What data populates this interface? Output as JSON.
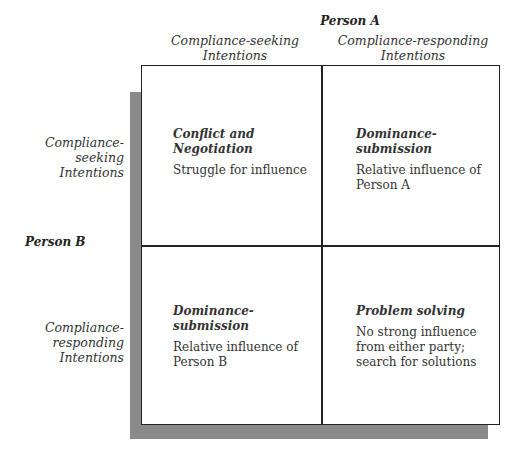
{
  "diagram": {
    "type": "2x2-matrix",
    "axis_top": {
      "label": "Person A",
      "columns": [
        {
          "line1": "Compliance-seeking",
          "line2": "Intentions"
        },
        {
          "line1": "Compliance-responding",
          "line2": "Intentions"
        }
      ]
    },
    "axis_left": {
      "label": "Person B",
      "rows": [
        {
          "line1": "Compliance-",
          "line2": "seeking",
          "line3": "Intentions"
        },
        {
          "line1": "Compliance-",
          "line2": "responding",
          "line3": "Intentions"
        }
      ]
    },
    "cells": [
      {
        "title": "Conflict and Negotiation",
        "lines": [
          "Struggle for influence"
        ]
      },
      {
        "title": "Dominance-submission",
        "lines": [
          "Relative influence of",
          "Person A"
        ]
      },
      {
        "title": "Dominance-submission",
        "lines": [
          "Relative influence of",
          "Person B"
        ]
      },
      {
        "title": "Problem solving",
        "lines": [
          "No strong influence",
          "from either party;",
          "search for solutions"
        ]
      }
    ],
    "colors": {
      "border": "#222222",
      "shadow": "#8a8a8a",
      "background": "#ffffff"
    }
  }
}
